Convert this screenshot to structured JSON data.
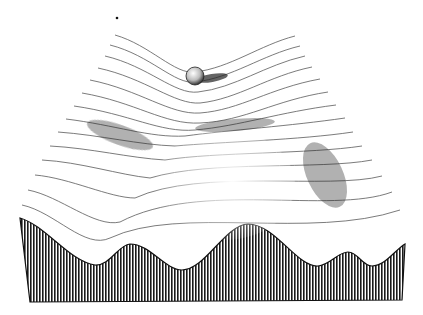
{
  "illustration": {
    "subject": "epigenetic landscape engraving",
    "elements": [
      "ball",
      "ridged surface",
      "valleys",
      "hatched front cross-section"
    ],
    "colors": {
      "ink": "#1a1a1a",
      "paper": "#ffffff"
    }
  }
}
